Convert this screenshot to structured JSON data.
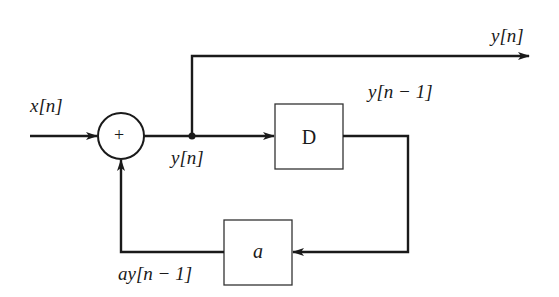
{
  "diagram": {
    "type": "block-diagram",
    "title": "",
    "input_label": "x[n]",
    "output_label": "y[n]",
    "node_label": "y[n]",
    "adder_symbol": "+",
    "delay_block": {
      "label": "D"
    },
    "delay_output_label": "y[n − 1]",
    "gain_block": {
      "label": "a"
    },
    "gain_output_label": "ay[n − 1]",
    "colors": {
      "line": "#1a1a1a",
      "background": "#ffffff",
      "box_stroke": "#333333"
    },
    "edges": [
      {
        "from": "x[n]",
        "to": "adder"
      },
      {
        "from": "adder",
        "to": "junction",
        "label": "y[n]"
      },
      {
        "from": "junction",
        "to": "output",
        "label": "y[n]"
      },
      {
        "from": "junction",
        "to": "D"
      },
      {
        "from": "D",
        "to": "a",
        "label": "y[n − 1]"
      },
      {
        "from": "a",
        "to": "adder",
        "label": "ay[n − 1]"
      }
    ]
  }
}
